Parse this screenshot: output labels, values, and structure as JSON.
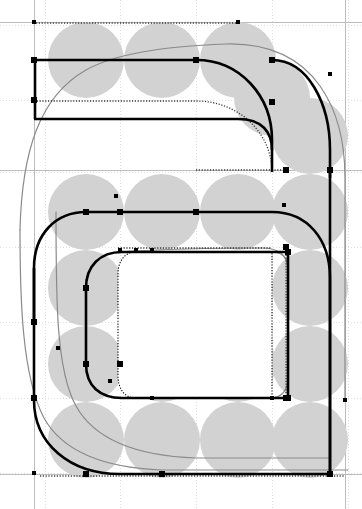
{
  "app": {
    "type": "font-glyph-editor-canvas",
    "title": "Glyph outline editor canvas",
    "canvas_width": 362,
    "canvas_height": 509,
    "background_color": "#ffffff"
  },
  "colors": {
    "background": "#ffffff",
    "pen_circle_fill": "#d2d2d2",
    "grid_line": "#e3dede",
    "guide_line": "#bdbdbd",
    "outline_stroke": "#000000",
    "skeleton_stroke": "#8a8a8a",
    "dotted_stroke": "#3a3a3a",
    "node_square_fill": "#000000",
    "node_handle_fill": "#000000"
  },
  "grid": {
    "label": "layout grid",
    "vertical_lines_x": [
      45,
      120,
      196,
      272,
      348
    ],
    "horizontal_lines_y": [
      25,
      100,
      172,
      247,
      322,
      398,
      473
    ],
    "spacing_px": 76,
    "visible": true,
    "style": "dotted"
  },
  "guides": {
    "label": "metric guides",
    "left_sidebearing_x": 34,
    "right_sidebearing_x": 345,
    "cap_height_y": 22,
    "baseline_y": 474,
    "x_height_y": 170,
    "visible": true
  },
  "pen_circles": {
    "label": "circular pen nib trace",
    "radius": 38,
    "fill": "#d2d2d2",
    "centers": [
      [
        86,
        60
      ],
      [
        162,
        60
      ],
      [
        238,
        60
      ],
      [
        86,
        212
      ],
      [
        162,
        212
      ],
      [
        238,
        212
      ],
      [
        310,
        212
      ],
      [
        86,
        288
      ],
      [
        310,
        288
      ],
      [
        86,
        364
      ],
      [
        162,
        364
      ],
      [
        238,
        364
      ],
      [
        310,
        364
      ],
      [
        86,
        440
      ],
      [
        162,
        440
      ],
      [
        238,
        440
      ],
      [
        310,
        440
      ],
      [
        310,
        136
      ],
      [
        272,
        98
      ]
    ]
  },
  "paths": {
    "outer_contour": {
      "name": "outer-outline-contour",
      "description": "heavy black outer outline of the glyph",
      "d": "M 34 22 L 34 60 L 285 60 C 310 60 330 82 330 110 L 330 430 L 330 474 L 34 474 L 34 430 C 34 402 54 382 80 382 L 120 382"
    },
    "skeleton_contour": {
      "name": "skeleton-stroke-path",
      "description": "thin gray construction / skeleton curve",
      "d": "M 34 170 C 34 110 80 60 140 60 L 250 60 C 310 60 345 110 345 170 L 345 400"
    },
    "counter_contour": {
      "name": "inner-counter-contour",
      "description": "inner white counter shape of the glyph",
      "d": "M 136 252 L 272 252 L 272 398 L 136 398 C 124 398 118 388 118 376 L 118 274 C 118 262 124 252 136 252 Z"
    }
  },
  "nodes": {
    "label": "bezier on-curve nodes (square) and off-curve handles (dot)",
    "square_size": 6,
    "dot_size": 4,
    "on_curve": [
      [
        34,
        60
      ],
      [
        34,
        100
      ],
      [
        34,
        322
      ],
      [
        34,
        398
      ],
      [
        86,
        212
      ],
      [
        86,
        288
      ],
      [
        86,
        364
      ],
      [
        120,
        212
      ],
      [
        120,
        364
      ],
      [
        196,
        60
      ],
      [
        196,
        212
      ],
      [
        272,
        60
      ],
      [
        272,
        102
      ],
      [
        286,
        170
      ],
      [
        286,
        247
      ],
      [
        286,
        398
      ],
      [
        288,
        252
      ],
      [
        288,
        398
      ],
      [
        330,
        170
      ],
      [
        330,
        474
      ],
      [
        162,
        474
      ],
      [
        86,
        474
      ]
    ],
    "off_curve": [
      [
        34,
        22
      ],
      [
        34,
        473
      ],
      [
        238,
        22
      ],
      [
        330,
        74
      ],
      [
        116,
        196
      ],
      [
        120,
        250
      ],
      [
        136,
        250
      ],
      [
        58,
        348
      ],
      [
        110,
        381
      ],
      [
        152,
        250
      ],
      [
        152,
        398
      ],
      [
        272,
        398
      ],
      [
        345,
        400
      ],
      [
        284,
        205
      ]
    ]
  },
  "statusbar": {
    "visible": false
  }
}
